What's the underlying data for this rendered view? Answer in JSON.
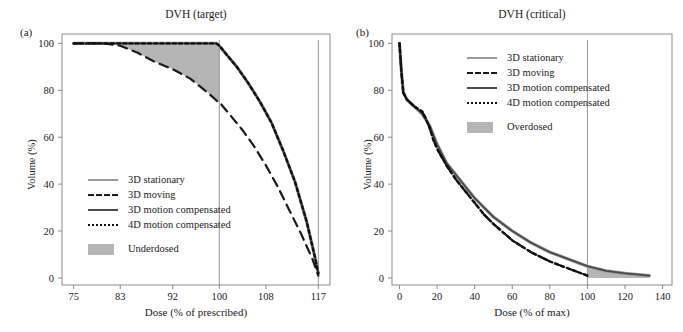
{
  "figure": {
    "panels": [
      {
        "tag": "(a)",
        "title": "DVH (target)",
        "xlabel": "Dose (% of prescribed)",
        "ylabel": "Volume (%)",
        "xticks": [
          75,
          83,
          92,
          100,
          108,
          117
        ],
        "yticks": [
          0,
          20,
          40,
          60,
          80,
          100
        ],
        "legend": [
          {
            "label": "3D stationary",
            "style": "solid-light"
          },
          {
            "label": "3D moving",
            "style": "dash-dark"
          },
          {
            "label": "3D motion compensated",
            "style": "solid-dark"
          },
          {
            "label": "4D motion compensated",
            "style": "dot-dark"
          },
          {
            "label": "Underdosed",
            "style": "area-gray"
          }
        ]
      },
      {
        "tag": "(b)",
        "title": "DVH (critical)",
        "xlabel": "Dose (% of max)",
        "ylabel": "Volume (%)",
        "xticks": [
          0,
          20,
          40,
          60,
          80,
          100,
          120,
          140
        ],
        "yticks": [
          0,
          20,
          40,
          60,
          80,
          100
        ],
        "legend": [
          {
            "label": "3D stationary",
            "style": "solid-light"
          },
          {
            "label": "3D moving",
            "style": "dash-dark"
          },
          {
            "label": "3D motion compensated",
            "style": "solid-dark"
          },
          {
            "label": "4D motion compensated",
            "style": "dot-dark"
          },
          {
            "label": "Overdosed",
            "style": "area-gray"
          }
        ]
      }
    ]
  },
  "colors": {
    "stationary": "#9a9a9a",
    "moving": "#1a1a1a",
    "motion_3d": "#4a4a4a",
    "motion_4d": "#111111",
    "shaded_region": "#b5b5b5",
    "axis": "#8c8c8c",
    "text": "#1a1a1a"
  },
  "chart_data": [
    {
      "type": "line",
      "panel": "a",
      "title": "DVH (target)",
      "xlabel": "Dose (% of prescribed)",
      "ylabel": "Volume (%)",
      "xlim": [
        73,
        119
      ],
      "ylim": [
        -3,
        104
      ],
      "xticks": [
        75,
        83,
        92,
        100,
        108,
        117
      ],
      "yticks": [
        0,
        20,
        40,
        60,
        80,
        100
      ],
      "grid": false,
      "legend_position": "center-left",
      "annotations": [
        {
          "type": "vline",
          "x": 100,
          "label": "prescribed dose"
        },
        {
          "type": "vline",
          "x": 117,
          "label": "max dose"
        },
        {
          "type": "shaded-area",
          "label": "Underdosed",
          "between": [
            "3D moving",
            "3D stationary"
          ],
          "x_range": [
            83,
            100
          ]
        }
      ],
      "series": [
        {
          "name": "3D stationary",
          "style": "solid",
          "color": "#9a9a9a",
          "x": [
            75,
            80,
            85,
            90,
            95,
            99.5,
            100,
            101,
            103,
            105,
            107,
            109,
            111,
            113,
            115,
            116.5,
            117
          ],
          "y": [
            100,
            100,
            100,
            100,
            100,
            100,
            99,
            96,
            90,
            83,
            75,
            66,
            54,
            41,
            24,
            8,
            2
          ]
        },
        {
          "name": "3D moving",
          "style": "dashed",
          "color": "#1a1a1a",
          "x": [
            75,
            80,
            83,
            86,
            89,
            92,
            95,
            98,
            99.8,
            100,
            102,
            104,
            106,
            108,
            110,
            112,
            114,
            116,
            117
          ],
          "y": [
            100,
            100,
            99,
            96,
            92,
            89,
            85,
            79,
            75,
            75,
            69,
            63,
            56,
            48,
            39,
            29,
            19,
            8,
            1
          ]
        },
        {
          "name": "3D motion compensated",
          "style": "solid",
          "color": "#4a4a4a",
          "x": [
            75,
            80,
            85,
            90,
            95,
            99.5,
            100,
            101,
            103,
            105,
            107,
            109,
            111,
            113,
            115,
            116.5,
            117
          ],
          "y": [
            100,
            100,
            100,
            100,
            100,
            100,
            99,
            96,
            90,
            83,
            75,
            66,
            54,
            41,
            24,
            8,
            2
          ]
        },
        {
          "name": "4D motion compensated",
          "style": "dotted",
          "color": "#111111",
          "x": [
            75,
            80,
            85,
            90,
            95,
            99.5,
            100,
            101,
            103,
            105,
            107,
            109,
            111,
            113,
            115,
            116.5,
            117
          ],
          "y": [
            100,
            100,
            100,
            100,
            100,
            100,
            99,
            96,
            90,
            83,
            75,
            66,
            54,
            41,
            24,
            8,
            2
          ]
        }
      ]
    },
    {
      "type": "line",
      "panel": "b",
      "title": "DVH (critical)",
      "xlabel": "Dose (% of max)",
      "ylabel": "Volume (%)",
      "xlim": [
        -4,
        145
      ],
      "ylim": [
        -3,
        104
      ],
      "xticks": [
        0,
        20,
        40,
        60,
        80,
        100,
        120,
        140
      ],
      "yticks": [
        0,
        20,
        40,
        60,
        80,
        100
      ],
      "grid": false,
      "legend_position": "upper-right",
      "annotations": [
        {
          "type": "vline",
          "x": 100,
          "label": "max dose"
        },
        {
          "type": "shaded-area",
          "label": "Overdosed",
          "between": [
            "3D stationary",
            "4D motion compensated"
          ],
          "x_range": [
            100,
            133
          ]
        }
      ],
      "series": [
        {
          "name": "3D stationary",
          "style": "solid",
          "color": "#9a9a9a",
          "x": [
            0,
            1,
            2,
            4,
            8,
            12,
            16,
            20,
            25,
            30,
            35,
            40,
            45,
            50,
            60,
            70,
            80,
            90,
            100,
            110,
            120,
            133
          ],
          "y": [
            100,
            88,
            79,
            76,
            73,
            70,
            65,
            57,
            49,
            44,
            39,
            34,
            30,
            26,
            20,
            15,
            11,
            8,
            5,
            3,
            2,
            1
          ]
        },
        {
          "name": "3D moving",
          "style": "dashed",
          "color": "#1a1a1a",
          "x": [
            0,
            1,
            2,
            4,
            8,
            12,
            14,
            16,
            18,
            20,
            25,
            30,
            35,
            40,
            45,
            50,
            60,
            70,
            80,
            90,
            100
          ],
          "y": [
            100,
            88,
            79,
            76,
            73,
            71,
            68,
            64,
            59,
            55,
            48,
            42,
            37,
            32,
            27,
            23,
            16,
            11,
            7,
            4,
            1
          ]
        },
        {
          "name": "3D motion compensated",
          "style": "solid",
          "color": "#4a4a4a",
          "x": [
            0,
            1,
            2,
            4,
            8,
            12,
            16,
            20,
            25,
            30,
            35,
            40,
            45,
            50,
            60,
            70,
            80,
            90,
            100,
            110,
            120,
            133
          ],
          "y": [
            100,
            88,
            79,
            76,
            73,
            70,
            65,
            57,
            49,
            44,
            39,
            34,
            30,
            26,
            20,
            15,
            11,
            8,
            5,
            3,
            2,
            1
          ]
        },
        {
          "name": "4D motion compensated",
          "style": "dotted",
          "color": "#111111",
          "x": [
            0,
            1,
            2,
            4,
            8,
            12,
            14,
            16,
            18,
            20,
            25,
            30,
            35,
            40,
            45,
            50,
            60,
            70,
            80,
            90,
            100
          ],
          "y": [
            100,
            88,
            79,
            76,
            73,
            71,
            68,
            64,
            59,
            55,
            48,
            42,
            37,
            32,
            27,
            23,
            16,
            11,
            7,
            4,
            1
          ]
        }
      ]
    }
  ]
}
